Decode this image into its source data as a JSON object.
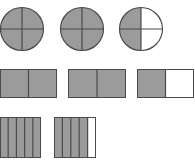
{
  "colors": {
    "shaded": "#9b9b9b",
    "unshaded": "#ffffff",
    "line": "#4a4a4a"
  },
  "diagram": {
    "rows": [
      {
        "shape": "circle",
        "parts_per_whole": 4,
        "wholes": [
          {
            "shaded_parts": 4
          },
          {
            "shaded_parts": 4
          },
          {
            "shaded_parts": 2
          }
        ]
      },
      {
        "shape": "rectangle-halves",
        "parts_per_whole": 2,
        "wholes": [
          {
            "shaded_parts": 2
          },
          {
            "shaded_parts": 2
          },
          {
            "shaded_parts": 1
          }
        ]
      },
      {
        "shape": "rectangle-fifths",
        "parts_per_whole": 5,
        "wholes": [
          {
            "shaded_parts": 5
          },
          {
            "shaded_parts": 4
          }
        ]
      }
    ]
  }
}
